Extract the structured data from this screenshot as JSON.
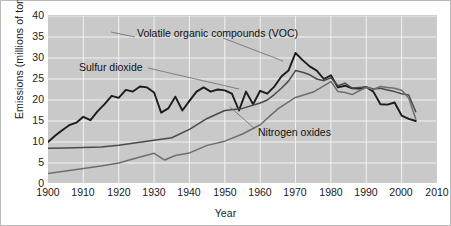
{
  "chart_data": {
    "type": "line",
    "title": "",
    "xlabel": "Year",
    "ylabel": "Emissions (millions of tons)",
    "xlim": [
      1900,
      2010
    ],
    "ylim": [
      0,
      40
    ],
    "xticks": [
      1900,
      1910,
      1920,
      1930,
      1940,
      1950,
      1960,
      1970,
      1980,
      1990,
      2000,
      2010
    ],
    "yticks": [
      0,
      5,
      10,
      15,
      20,
      25,
      30,
      35,
      40
    ],
    "grid": true,
    "legend_position": "inline-annotations",
    "plot_background": "#c9c9c9",
    "gridline_color": "#f2f2f2",
    "annotations": [
      {
        "name": "voc-label",
        "text": "Volatile organic compounds (VOC)",
        "points_to_year": 1965,
        "points_to_value": 28.5
      },
      {
        "name": "so2-label",
        "text": "Sulfur dioxide",
        "points_to_year": 1955,
        "points_to_value": 18.5
      },
      {
        "name": "nox-label",
        "text": "Nitrogen oxides",
        "points_to_year": 1964,
        "points_to_value": 17.5
      }
    ],
    "series": [
      {
        "name": "Sulfur dioxide",
        "color": "#1c1c1c",
        "x": [
          1900,
          1902,
          1904,
          1906,
          1908,
          1910,
          1912,
          1914,
          1916,
          1918,
          1920,
          1922,
          1924,
          1926,
          1928,
          1930,
          1932,
          1934,
          1936,
          1938,
          1940,
          1942,
          1944,
          1946,
          1948,
          1950,
          1952,
          1954,
          1956,
          1958,
          1960,
          1962,
          1964,
          1966,
          1968,
          1970,
          1972,
          1974,
          1976,
          1978,
          1980,
          1982,
          1984,
          1986,
          1988,
          1990,
          1992,
          1994,
          1996,
          1998,
          2000,
          2002,
          2004
        ],
        "values": [
          10.0,
          11.5,
          12.8,
          14.0,
          14.6,
          16.0,
          15.2,
          17.3,
          19.0,
          21.0,
          20.5,
          22.4,
          22.0,
          23.2,
          23.0,
          21.8,
          17.0,
          18.0,
          20.8,
          17.5,
          19.8,
          22.0,
          23.0,
          22.0,
          22.5,
          22.3,
          21.5,
          17.5,
          22.0,
          19.0,
          22.2,
          21.5,
          23.2,
          25.6,
          27.0,
          31.2,
          29.5,
          28.0,
          27.0,
          25.0,
          25.9,
          23.0,
          23.4,
          22.8,
          22.7,
          23.1,
          22.0,
          19.0,
          18.9,
          19.4,
          16.3,
          15.5,
          15.0
        ]
      },
      {
        "name": "Volatile organic compounds (VOC)",
        "color": "#4a4a4a",
        "x": [
          1900,
          1905,
          1910,
          1915,
          1920,
          1925,
          1930,
          1935,
          1940,
          1945,
          1950,
          1955,
          1960,
          1962,
          1964,
          1966,
          1968,
          1970,
          1972,
          1974,
          1976,
          1978,
          1980,
          1982,
          1984,
          1986,
          1988,
          1990,
          1992,
          1994,
          1996,
          1998,
          2000,
          2002,
          2004
        ],
        "values": [
          8.5,
          8.6,
          8.7,
          8.8,
          9.2,
          9.8,
          10.4,
          11.0,
          13.0,
          15.6,
          17.5,
          18.0,
          19.3,
          20.0,
          21.3,
          22.8,
          24.5,
          27.0,
          26.6,
          26.0,
          25.0,
          24.6,
          25.3,
          23.4,
          24.0,
          22.8,
          23.0,
          23.1,
          22.6,
          22.8,
          22.4,
          22.0,
          21.5,
          21.2,
          17.2
        ]
      },
      {
        "name": "Nitrogen oxides",
        "color": "#6e6e6e",
        "x": [
          1900,
          1905,
          1910,
          1915,
          1920,
          1925,
          1930,
          1933,
          1936,
          1940,
          1945,
          1950,
          1955,
          1960,
          1965,
          1970,
          1975,
          1980,
          1982,
          1984,
          1986,
          1988,
          1990,
          1992,
          1994,
          1996,
          1998,
          2000,
          2002,
          2004
        ],
        "values": [
          2.5,
          3.1,
          3.7,
          4.3,
          5.0,
          6.2,
          7.3,
          5.7,
          6.8,
          7.4,
          9.2,
          10.2,
          11.9,
          14.1,
          17.9,
          20.6,
          21.9,
          24.4,
          22.0,
          21.8,
          21.3,
          22.2,
          23.0,
          22.5,
          23.2,
          23.0,
          22.8,
          22.3,
          20.5,
          15.5
        ]
      }
    ]
  },
  "axis": {
    "ylabel_text": "Emissions (millions of tons)",
    "xlabel_text": "Year",
    "ytick_labels": [
      "40",
      "35",
      "30",
      "25",
      "20",
      "15",
      "10",
      "5",
      "0"
    ],
    "xtick_labels": [
      "1900",
      "1910",
      "1920",
      "1930",
      "1940",
      "1950",
      "1960",
      "1970",
      "1980",
      "1990",
      "2000",
      "2010"
    ]
  },
  "labels": {
    "voc": "Volatile organic compounds (VOC)",
    "so2": "Sulfur dioxide",
    "nox": "Nitrogen oxides"
  }
}
